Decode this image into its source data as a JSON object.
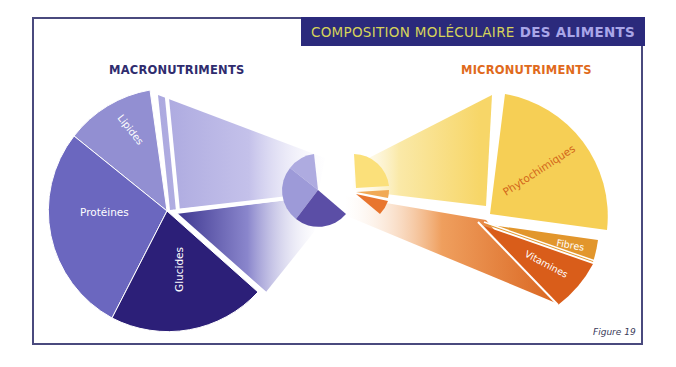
{
  "title": {
    "part1": "COMPOSITION MOLÉCULAIRE",
    "part2": "DES ALIMENTS"
  },
  "sections": {
    "macro": "MACRONUTRIMENTS",
    "micro": "MICRONUTRIMENTS"
  },
  "macronutriments": [
    {
      "label": "Lipides",
      "color": "#8f8cd0"
    },
    {
      "label": "Protéines",
      "color": "#6a66bd"
    },
    {
      "label": "Glucides",
      "color": "#2c1f78"
    }
  ],
  "micronutriments": [
    {
      "label": "Phytochimiques",
      "color": "#f6cf55"
    },
    {
      "label": "Fibres",
      "color": "#e2962c"
    },
    {
      "label": "Vitamines",
      "color": "#d95d1a"
    }
  ],
  "colors": {
    "frame": "#4a4a7e",
    "title_bg": "#2b2a7c",
    "title_text1": "#d6d45a",
    "title_text2": "#a9a6e8",
    "macro_heading": "#2f2c6e",
    "micro_heading": "#e06a1c",
    "label_macro": "#ffffff",
    "label_phyto": "#d2661a"
  },
  "figure_caption": "Figure 19"
}
